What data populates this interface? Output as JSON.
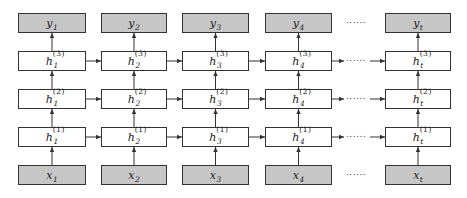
{
  "diagram": {
    "type": "stacked-rnn",
    "columns": [
      {
        "id": "1",
        "x": 18,
        "w": 68
      },
      {
        "id": "2",
        "x": 101,
        "w": 66
      },
      {
        "id": "3",
        "x": 182,
        "w": 67
      },
      {
        "id": "4",
        "x": 265,
        "w": 67
      },
      {
        "id": "t",
        "x": 385,
        "w": 66
      }
    ],
    "rows": [
      {
        "kind": "output",
        "y": 13,
        "h": 20,
        "var": "y",
        "layer": ""
      },
      {
        "kind": "hidden",
        "y": 51,
        "h": 20,
        "var": "h",
        "layer": "(3)"
      },
      {
        "kind": "hidden",
        "y": 89,
        "h": 20,
        "var": "h",
        "layer": "(2)"
      },
      {
        "kind": "hidden",
        "y": 127,
        "h": 20,
        "var": "h",
        "layer": "(1)"
      },
      {
        "kind": "input",
        "y": 165,
        "h": 20,
        "var": "x",
        "layer": ""
      }
    ],
    "labels": {
      "y": [
        "y",
        "y",
        "y",
        "y",
        "y"
      ],
      "subscripts": [
        "1",
        "2",
        "3",
        "4",
        "t"
      ],
      "h3_sup": "(3)",
      "h2_sup": "(2)",
      "h1_sup": "(1)"
    },
    "ellipsis": "......",
    "colors": {
      "io_fill": "#c6c6c6",
      "hidden_fill": "#ffffff",
      "stroke": "#333333"
    }
  }
}
